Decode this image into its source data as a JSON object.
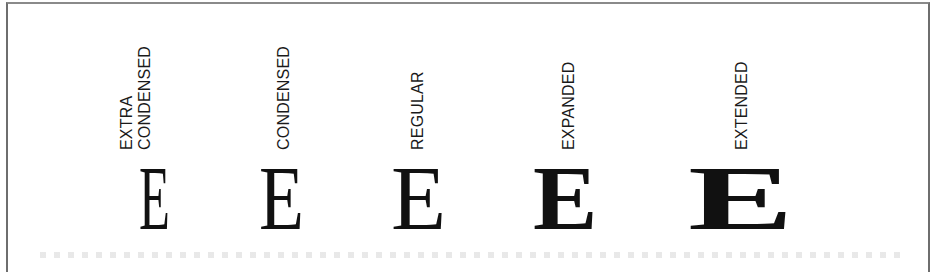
{
  "figure": {
    "variants": [
      {
        "label_lines": [
          "EXTRA",
          "CONDENSED"
        ],
        "glyph": "E",
        "width": "extra-condensed"
      },
      {
        "label_lines": [
          "CONDENSED"
        ],
        "glyph": "E",
        "width": "condensed"
      },
      {
        "label_lines": [
          "REGULAR"
        ],
        "glyph": "E",
        "width": "regular"
      },
      {
        "label_lines": [
          "EXPANDED"
        ],
        "glyph": "E",
        "width": "expanded"
      },
      {
        "label_lines": [
          "EXTENDED"
        ],
        "glyph": "E",
        "width": "extended"
      }
    ]
  },
  "colors": {
    "ink": "#111111",
    "border": "#6e6e6e",
    "background": "#ffffff"
  }
}
